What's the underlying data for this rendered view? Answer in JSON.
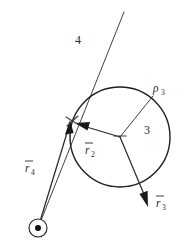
{
  "figure": {
    "background_color": "#ffffff",
    "line_color": "#2b2b2b",
    "width": 185,
    "height": 250
  },
  "labels": {
    "link4": "4",
    "link3": "3",
    "rho3_symbol": "ρ",
    "rho3_subscript": "3",
    "r2_symbol": "r",
    "r2_subscript": "2",
    "r3_symbol": "r",
    "r3_subscript": "3",
    "r4_symbol": "r",
    "r4_subscript": "4"
  },
  "geometry": {
    "circle": {
      "center_x": 120,
      "center_y": 137,
      "radius": 50
    },
    "ground_pivot": {
      "center_x": 38,
      "center_y": 228,
      "ring_radius": 9,
      "dot_radius": 3
    },
    "slider_joint": {
      "x": 72,
      "y": 121
    },
    "line4": {
      "x1": 124,
      "y1": 12,
      "x2": 38,
      "y2": 228
    },
    "vector_r2": {
      "x1": 120,
      "y1": 137,
      "x2": 76,
      "y2": 124
    },
    "vector_r3": {
      "x1": 120,
      "y1": 137,
      "x2": 148,
      "y2": 206
    },
    "vector_r4": {
      "x1": 38,
      "y1": 228,
      "x2": 70,
      "y2": 123
    },
    "line_rho3": {
      "x1": 120,
      "y1": 137,
      "x2": 153,
      "y2": 96
    }
  }
}
